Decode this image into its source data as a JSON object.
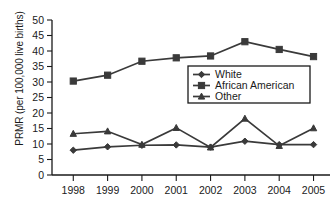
{
  "chart_data": {
    "type": "line",
    "title": "",
    "xlabel": "",
    "ylabel": "PRMR (per 100,000 live births)",
    "categories": [
      "1998",
      "1999",
      "2000",
      "2001",
      "2002",
      "2003",
      "2004",
      "2005"
    ],
    "x": [
      1998,
      1999,
      2000,
      2001,
      2002,
      2003,
      2004,
      2005
    ],
    "ylim": [
      0,
      50
    ],
    "yticks": [
      0,
      5,
      10,
      15,
      20,
      25,
      30,
      35,
      40,
      45,
      50
    ],
    "grid": false,
    "legend_position": "center-right",
    "series": [
      {
        "name": "White",
        "marker": "diamond",
        "color": "#3a3a3a",
        "values": [
          8.0,
          9.1,
          9.6,
          9.7,
          9.0,
          10.9,
          9.8,
          9.8
        ]
      },
      {
        "name": "African American",
        "marker": "square",
        "color": "#3a3a3a",
        "values": [
          30.3,
          32.2,
          36.7,
          37.8,
          38.4,
          43.0,
          40.5,
          38.2
        ]
      },
      {
        "name": "Other",
        "marker": "triangle",
        "color": "#3a3a3a",
        "values": [
          13.3,
          14.1,
          9.8,
          15.2,
          8.9,
          18.2,
          9.4,
          15.1
        ]
      }
    ]
  },
  "axis": {
    "y_tick_labels": [
      "0",
      "5",
      "10",
      "15",
      "20",
      "25",
      "30",
      "35",
      "40",
      "45",
      "50"
    ],
    "x_tick_labels": [
      "1998",
      "1999",
      "2000",
      "2001",
      "2002",
      "2003",
      "2004",
      "2005"
    ],
    "y_axis_title": "PRMR (per 100,000 live births)"
  },
  "legend": {
    "entries": [
      {
        "label": "White"
      },
      {
        "label": "African American"
      },
      {
        "label": "Other"
      }
    ]
  }
}
